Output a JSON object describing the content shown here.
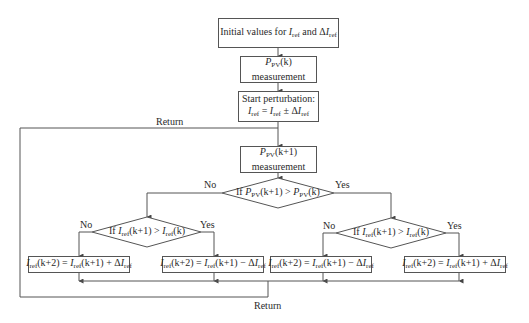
{
  "diagram": {
    "type": "flowchart",
    "nodes": {
      "init": {
        "text": "Initial values for I_ref and ΔI_ref"
      },
      "measure_k": {
        "line1": "P_PV(k)",
        "line2": "measurement"
      },
      "perturb": {
        "line1": "Start perturbation:",
        "line2": "I_ref = I_ref ± ΔI_ref"
      },
      "measure_k1": {
        "line1": "P_PV(k+1)",
        "line2": "measurement"
      },
      "decision_power": {
        "text": "If P_PV(k+1) > P_PV(k)"
      },
      "decision_left": {
        "text": "If I_ref(k+1) > I_ref(k)"
      },
      "decision_right": {
        "text": "If I_ref(k+1) > I_ref(k)"
      },
      "out_ll": {
        "text": "I_ref(k+2) = I_ref(k+1) + ΔI_ref"
      },
      "out_lr": {
        "text": "I_ref(k+2) = I_ref(k+1) − ΔI_ref"
      },
      "out_rl": {
        "text": "I_ref(k+2) = I_ref(k+1) − ΔI_ref"
      },
      "out_rr": {
        "text": "I_ref(k+2) = I_ref(k+1) + ΔI_ref"
      }
    },
    "labels": {
      "no": "No",
      "yes": "Yes",
      "return_top": "Return",
      "return_bottom": "Return"
    },
    "parts": {
      "initial_values_for": "Initial values for",
      "and": "and",
      "delta": "Δ",
      "I": "I",
      "P": "P",
      "ref": "ref",
      "pv": "PV",
      "k": "(k)",
      "k1": "(k+1)",
      "k2": "(k+2)",
      "measurement": "measurement",
      "start_perturbation": "Start perturbation:",
      "if": "If",
      "gt": " > ",
      "eq": " = ",
      "pm": " ± ",
      "plus": " + ",
      "minus": " − "
    },
    "colors": {
      "line": "#555555",
      "text": "#2a2a2a",
      "background": "#ffffff"
    }
  }
}
